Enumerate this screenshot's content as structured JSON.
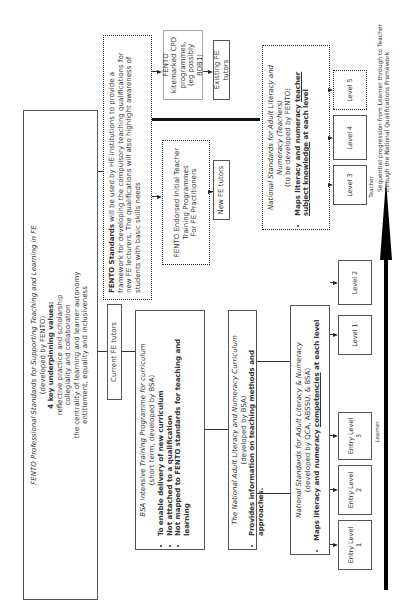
{
  "fento_main": {
    "title": "FENTO Professional Standards for Supporting Teaching and Learning in FE",
    "subtitle": "(developed by FENTO)",
    "values_heading": "4 key underpinning values:",
    "values": [
      "reflective practice and scholarship",
      "collegiality and collaboration",
      "the centrality of learning and learner autonomy",
      "entitlement, equality and inclusiveness"
    ]
  },
  "fento_standards_he": {
    "bold_lead": "FENTO Standards",
    "text": "will be used by HE institutions to provide a framework for developing the compulsory teaching qualifications for new FE lecturers. The qualifications will also highlight awareness of students with basic skills needs"
  },
  "kitemarked_cpd": {
    "line1": "FENTO kitemarked CPD",
    "line2": "programmes,",
    "line3": "(eg possibly BDB1)"
  },
  "existing_tutors": {
    "label": "Existing FE tutors"
  },
  "endorsed_itt": {
    "line1": "FENTO Endorsed Initial Teacher",
    "line2": "Training Programmes",
    "line3": "For FE Practitioners"
  },
  "new_tutors": {
    "label": "New FE tutors"
  },
  "current_tutors": {
    "label": "Current FE tutors"
  },
  "bsa_training": {
    "title": "BSA Intensive Training Programme for curriculum",
    "subtitle": "(short term, developed by BSA)",
    "bullets": [
      "To enable delivery of new curriculum",
      "Not attached to a qualification",
      "Not mapped to FENTO standards for teaching and learning"
    ]
  },
  "curriculum": {
    "title": "The National Adult Literacy and Numeracy Curriculum",
    "subtitle": "(developed by BSA)",
    "bullet": "Provides information on teaching methods and approaches."
  },
  "learner_standards": {
    "title": "National Standards for Adult Literacy & Numeracy",
    "subtitle": "(developed by QCA, ABSSU, & BSA)",
    "bullet_lead": "Maps literacy and numeracy ",
    "bullet_underlined": "competencies",
    "bullet_tail": " at each level"
  },
  "teacher_standards": {
    "title": "National Standards for Adult Literacy and Numeracy (Teachers)",
    "subtitle": "(to be developed by FENTO)",
    "bullet_lead": "Maps literacy and numeracy ",
    "bullet_underlined": "teacher subject knowledge",
    "bullet_tail": " at each level"
  },
  "levels": {
    "entry1": "Entry Level 1",
    "entry2": "Entry Level 2",
    "entry3": "Entry Level 3",
    "level1": "Level 1",
    "level2": "Level 2",
    "level3": "Level 3",
    "level4": "Level 4",
    "level5": "Level 5"
  },
  "progression": {
    "learner_label": "Learner",
    "teacher_label": "Teacher",
    "caption_line1": "Sequential progression from Learner through to Teacher",
    "caption_line2": "through the National Qualifications Framework"
  }
}
